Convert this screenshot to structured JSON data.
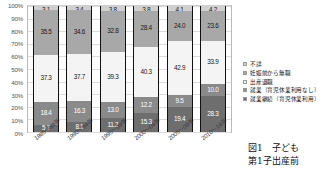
{
  "chart_data": {
    "type": "bar",
    "title": "",
    "xlabel": "",
    "ylabel": "",
    "ylim": [
      0,
      100
    ],
    "grid": true,
    "stacked": true,
    "normalized_percent": true,
    "legend_position": "right",
    "categories": [
      "1985～89年",
      "1990～94年",
      "1995～99年",
      "2000～04年",
      "2005～09年",
      "2010～14年"
    ],
    "y_ticks": [
      "0%",
      "10%",
      "20%",
      "30%",
      "40%",
      "50%",
      "60%",
      "70%",
      "80%",
      "90%",
      "100%"
    ],
    "series": [
      {
        "name": "就業継続（育児休業利用）",
        "color": "#6e6e6e",
        "values": [
          5.7,
          8.1,
          11.2,
          15.3,
          19.4,
          28.3
        ]
      },
      {
        "name": "就業（育児休業利用なし）",
        "color": "#8a8a8a",
        "values": [
          18.4,
          16.3,
          13.0,
          12.2,
          9.5,
          10.0
        ]
      },
      {
        "name": "出産退職",
        "color": "#f4f4f4",
        "values": [
          37.3,
          37.7,
          39.3,
          40.3,
          42.9,
          33.9
        ]
      },
      {
        "name": "妊娠前から無職",
        "color": "#a8a8a8",
        "values": [
          35.5,
          34.6,
          32.8,
          28.4,
          24.0,
          23.6
        ]
      },
      {
        "name": "不詳",
        "color": "#d0d0d0",
        "values": [
          3.1,
          3.4,
          3.8,
          3.8,
          4.1,
          4.2
        ]
      }
    ],
    "legend_order_top_to_bottom": [
      "不詳",
      "妊娠前から無職",
      "出産退職",
      "就業（育児休業利用なし）",
      "就業継続（育児休業利用）"
    ]
  },
  "legend": {
    "items": [
      {
        "label": "不詳",
        "swatch": "sw-fushou"
      },
      {
        "label": "妊娠前から無職",
        "swatch": "sw-mushoku"
      },
      {
        "label": "出産退職",
        "swatch": "sw-taishoku"
      },
      {
        "label": "就業（育児休業利用なし）",
        "swatch": "sw-nokyuugyou"
      },
      {
        "label": "就業継続（育児休業利用）",
        "swatch": "sw-keizoku"
      }
    ]
  },
  "caption": {
    "line1": "図1　子ども",
    "line2": "第1子出産前"
  }
}
